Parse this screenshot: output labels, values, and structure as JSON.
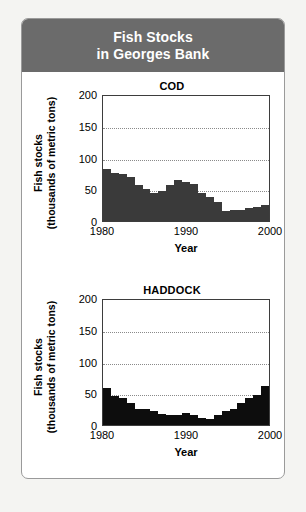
{
  "header": {
    "title_line1": "Fish Stocks",
    "title_line2": "in Georges Bank",
    "background_color": "#6b6b6b",
    "text_color": "#ffffff"
  },
  "card": {
    "background_color": "#ffffff",
    "border_color": "#9a9a9a"
  },
  "axis_common": {
    "ylabel_line1": "Fish stocks",
    "ylabel_line2": "(thousands of metric tons)",
    "xlabel": "Year",
    "yticks": [
      "200",
      "150",
      "100",
      "50",
      "0"
    ],
    "xticks": [
      "1980",
      "1990",
      "2000"
    ]
  },
  "chart_data": [
    {
      "type": "area",
      "title": "COD",
      "xlabel": "Year",
      "ylabel": "Fish stocks (thousands of metric tons)",
      "ylim": [
        0,
        200
      ],
      "xlim": [
        1980,
        2000
      ],
      "yticks": [
        0,
        50,
        100,
        150,
        200
      ],
      "xticks": [
        1980,
        1990,
        2000
      ],
      "grid": true,
      "fill_color": "#3a3a3a",
      "categories": [
        1980,
        1981,
        1982,
        1983,
        1984,
        1985,
        1986,
        1987,
        1988,
        1989,
        1990,
        1991,
        1992,
        1993,
        1994,
        1995,
        1996,
        1997,
        1998,
        1999,
        2000
      ],
      "values": [
        82,
        76,
        74,
        70,
        57,
        50,
        44,
        48,
        57,
        65,
        62,
        58,
        44,
        38,
        30,
        16,
        17,
        18,
        20,
        22,
        25
      ]
    },
    {
      "type": "area",
      "title": "HADDOCK",
      "xlabel": "Year",
      "ylabel": "Fish stocks (thousands of metric tons)",
      "ylim": [
        0,
        200
      ],
      "xlim": [
        1980,
        2000
      ],
      "yticks": [
        0,
        50,
        100,
        150,
        200
      ],
      "xticks": [
        1980,
        1990,
        2000
      ],
      "grid": true,
      "fill_color": "#0d0d0d",
      "categories": [
        1980,
        1981,
        1982,
        1983,
        1984,
        1985,
        1986,
        1987,
        1988,
        1989,
        1990,
        1991,
        1992,
        1993,
        1994,
        1995,
        1996,
        1997,
        1998,
        1999,
        2000
      ],
      "values": [
        58,
        45,
        42,
        34,
        26,
        25,
        22,
        17,
        16,
        16,
        19,
        16,
        11,
        9,
        15,
        22,
        26,
        34,
        42,
        48,
        62
      ]
    }
  ]
}
